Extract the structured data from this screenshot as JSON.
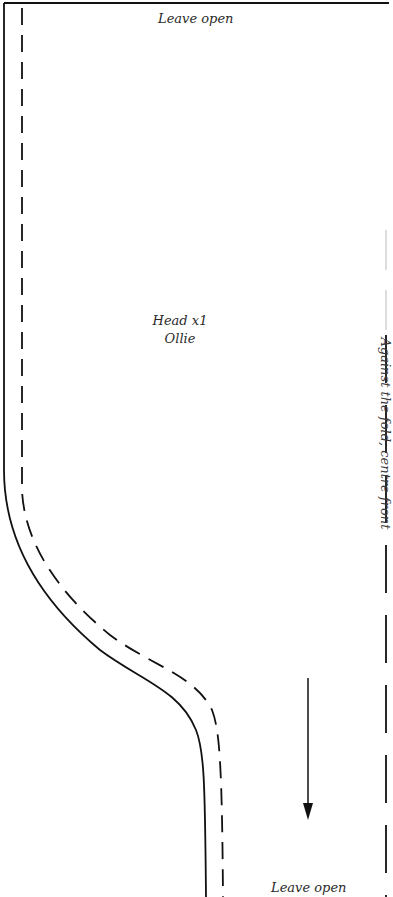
{
  "pattern": {
    "top_edge_note": "Leave open",
    "bottom_edge_note": "Leave open",
    "piece": {
      "name": "Head x1",
      "character": "Ollie"
    },
    "fold_note": "Against the fold, centre front",
    "grainline": {
      "direction": "down",
      "icon": "grainline-arrow-icon"
    }
  },
  "colors": {
    "line": "#111111",
    "text": "#2a2a2a",
    "background": "#ffffff"
  }
}
